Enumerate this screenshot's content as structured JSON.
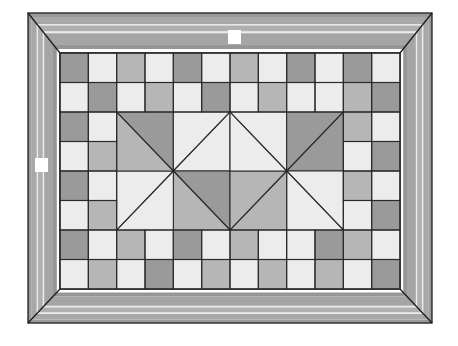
{
  "artwork": {
    "title": "Framed geometric quilt mosaic",
    "canvas": {
      "width": 458,
      "height": 346,
      "background": "#ffffff"
    },
    "frame": {
      "name": "mitred-picture-frame",
      "outer": {
        "x": 28,
        "y": 13,
        "width": 404,
        "height": 310
      },
      "inner": {
        "x": 60,
        "y": 53,
        "width": 340,
        "height": 236
      },
      "corner_style": "mitred",
      "outline_color": "#1c1c1c",
      "bands": [
        {
          "name": "outer-bevel",
          "color": "#9a9a9a",
          "inset": 0,
          "thickness": 4
        },
        {
          "name": "outer-field",
          "color": "#a8a8a8",
          "inset": 4,
          "thickness": 7
        },
        {
          "name": "highlight-1",
          "color": "#e8e8e8",
          "inset": 11,
          "thickness": 1.6
        },
        {
          "name": "mid-field",
          "color": "#b0b0b0",
          "inset": 12.6,
          "thickness": 6
        },
        {
          "name": "highlight-2",
          "color": "#ebebeb",
          "inset": 18.6,
          "thickness": 1.6
        },
        {
          "name": "inner-field",
          "color": "#a5a5a5",
          "inset": 20.2,
          "thickness": 11
        },
        {
          "name": "inner-bevel",
          "color": "#969696",
          "inset": 31.2,
          "thickness": 4.8
        }
      ]
    },
    "markers": [
      {
        "name": "top-marker-tag",
        "x": 228,
        "y": 30,
        "width": 13,
        "height": 14,
        "color": "#ffffff"
      },
      {
        "name": "left-marker-tag",
        "x": 35,
        "y": 158,
        "width": 13,
        "height": 14,
        "color": "#ffffff"
      }
    ],
    "palette": {
      "light": "#ececec",
      "mid": "#b6b6b6",
      "dark": "#9a9a9a",
      "line": "#2a2a2a",
      "frame_light": "#e9e9e9",
      "frame_mid": "#b0b0b0",
      "frame_dark": "#9a9a9a"
    },
    "field": {
      "name": "quilt-field",
      "x": 60,
      "y": 53,
      "width": 340,
      "height": 236,
      "columns": 12,
      "rows": 8,
      "cell_width": 28.333,
      "cell_height": 29.5,
      "grid_line_color": "#2a2a2a",
      "grid_line_width": 1.1,
      "patch_rows": [
        [
          "dark",
          "light",
          "mid",
          "light",
          "dark",
          "light",
          "mid",
          "light",
          "dark",
          "light",
          "dark",
          "light"
        ],
        [
          "light",
          "dark",
          "light",
          "mid",
          "light",
          "dark",
          "light",
          "mid",
          "light",
          "light",
          "mid",
          "dark"
        ],
        [
          "dark",
          "light",
          "S",
          "S",
          "S",
          "S",
          "S",
          "S",
          "S",
          "S",
          "mid",
          "light"
        ],
        [
          "light",
          "mid",
          "S",
          "S",
          "S",
          "S",
          "S",
          "S",
          "S",
          "S",
          "light",
          "dark"
        ],
        [
          "dark",
          "light",
          "S",
          "S",
          "S",
          "S",
          "S",
          "S",
          "S",
          "S",
          "mid",
          "light"
        ],
        [
          "light",
          "mid",
          "S",
          "S",
          "S",
          "S",
          "S",
          "S",
          "S",
          "S",
          "light",
          "dark"
        ],
        [
          "dark",
          "light",
          "mid",
          "light",
          "dark",
          "light",
          "mid",
          "light",
          "light",
          "dark",
          "mid",
          "light"
        ],
        [
          "light",
          "mid",
          "light",
          "dark",
          "light",
          "mid",
          "light",
          "mid",
          "light",
          "mid",
          "light",
          "dark"
        ]
      ],
      "star_blocks": [
        {
          "name": "pinwheel-star-left",
          "col_start": 2,
          "col_span": 4,
          "row_start": 2,
          "row_span": 4,
          "triangles": [
            "dark",
            "light",
            "light",
            "dark",
            "mid",
            "light",
            "light",
            "mid"
          ]
        },
        {
          "name": "pinwheel-star-right",
          "col_start": 6,
          "col_span": 4,
          "row_start": 2,
          "row_span": 4,
          "triangles": [
            "light",
            "dark",
            "dark",
            "light",
            "light",
            "mid",
            "mid",
            "light"
          ]
        }
      ]
    }
  }
}
